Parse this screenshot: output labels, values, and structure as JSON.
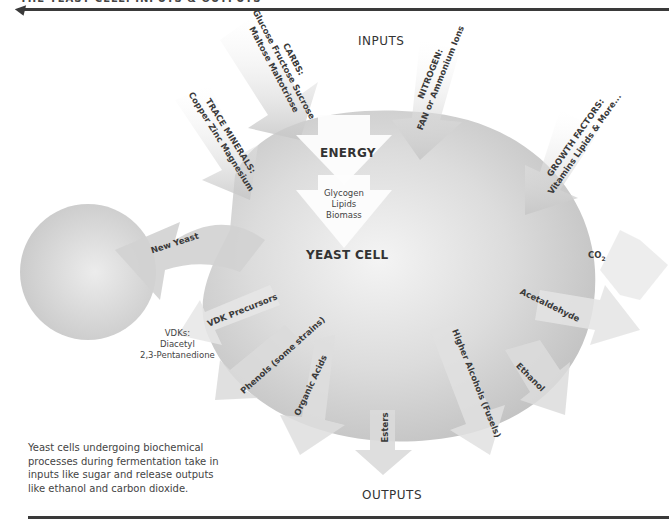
{
  "header": {
    "title": "THE YEAST CELL: INPUTS & OUTPUTS"
  },
  "diagram": {
    "inputs_title": "INPUTS",
    "outputs_title": "OUTPUTS",
    "cell_label": "YEAST CELL",
    "energy_label": "ENERGY",
    "storage": [
      "Glycogen",
      "Lipids",
      "Biomass"
    ],
    "inputs": {
      "carbs": {
        "title": "CARBS:",
        "line1": "Glucose Fructose Sucrose",
        "line2": "Maltose Maltotriose"
      },
      "nitrogen": {
        "title": "NITROGEN:",
        "line1": "FAN or Ammonium Ions"
      },
      "trace_minerals": {
        "title": "TRACE MINERALS:",
        "line1": "Copper Zinc Magnesium"
      },
      "growth_factors": {
        "title": "GROWTH FACTORS:",
        "line1": "Vitamins Lipids & More..."
      }
    },
    "outputs": {
      "new_yeast": "New Yeast",
      "co2": "CO",
      "co2_sub": "2",
      "acetaldehyde": "Acetaldehyde",
      "ethanol": "Ethanol",
      "higher_alcohols": "Higher Alcohols (Fusels)",
      "esters": "Esters",
      "organic_acids": "Organic Acids",
      "phenols": "Phenols (some strains)",
      "vdk_precursors": "VDK Precursors",
      "vdks": {
        "title": "VDKs:",
        "line1": "Diacetyl",
        "line2": "2,3-Pentanedione"
      }
    }
  },
  "caption": "Yeast cells undergoing biochemical processes during fermentation take in inputs like sugar and release outputs like ethanol and carbon dioxide.",
  "colors": {
    "rule": "#3a3a3a",
    "shape_light": "#f2f2f2",
    "shape_dark": "#c4c4c4"
  }
}
